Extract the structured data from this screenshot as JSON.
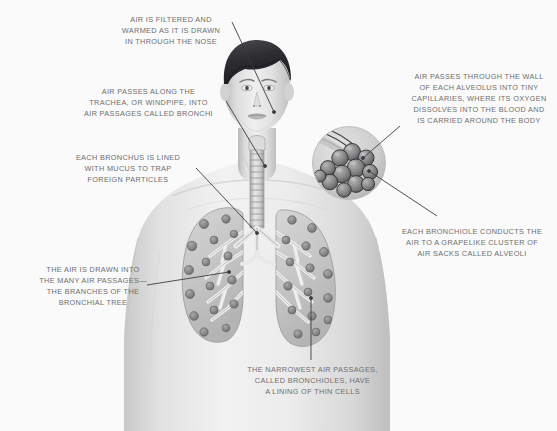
{
  "illustration": {
    "title": "Human Respiratory System",
    "subject": "respiratory-system-diagram",
    "background_color": "#fafafa",
    "text_color": "#6e6e6e",
    "leader_color": "#3c3c46",
    "figure_description": "Grayscale anatomical illustration of a person's head and upper torso shown front-facing, with the trachea, bronchi and both lungs rendered internally, plus a circular magnified inset of an alveolar cluster at the upper right"
  },
  "annotations": [
    {
      "id": "nose",
      "text": "AIR IS FILTERED AND\nWARMED AS IT IS DRAWN\nIN THROUGH THE NOSE",
      "align": "center",
      "x": 115,
      "y": 14,
      "width": 112,
      "leader": {
        "x1": 232,
        "y1": 22,
        "x2": 274,
        "y2": 112
      }
    },
    {
      "id": "trachea",
      "text": "AIR PASSES ALONG THE\nTRACHEA, OR WINDPIPE, INTO\nAIR PASSAGES CALLED BRONCHI",
      "align": "center",
      "x": 76,
      "y": 86,
      "width": 145,
      "leader": {
        "x1": 226,
        "y1": 101,
        "x2": 265,
        "y2": 166
      }
    },
    {
      "id": "bronchus",
      "text": "EACH BRONCHUS IS LINED\nWITH MUCUS TO TRAP\nFOREIGN PARTICLES",
      "align": "center",
      "x": 64,
      "y": 152,
      "width": 128,
      "leader": {
        "x1": 196,
        "y1": 168,
        "x2": 257,
        "y2": 233
      }
    },
    {
      "id": "bronchial-tree",
      "text": "THE AIR IS DRAWN INTO\nTHE MANY AIR PASSAGES—\nTHE BRANCHES OF THE\nBRONCHIAL TREE",
      "align": "center",
      "x": 28,
      "y": 264,
      "width": 130,
      "leader": {
        "x1": 147,
        "y1": 285,
        "x2": 229,
        "y2": 272
      }
    },
    {
      "id": "bronchioles",
      "text": "THE NARROWEST AIR PASSAGES,\nCALLED BRONCHIOLES, HAVE\nA LINING OF THIN CELLS",
      "align": "center",
      "x": 239,
      "y": 364,
      "width": 147,
      "leader": {
        "x1": 311,
        "y1": 360,
        "x2": 311,
        "y2": 298
      }
    },
    {
      "id": "alveolus-wall",
      "text": "AIR PASSES THROUGH THE WALL\nOF EACH ALVEOLUS INTO TINY\nCAPILLARIES, WHERE ITS OXYGEN\nDISSOLVES INTO THE BLOOD AND\nIS CARRIED AROUND THE BODY",
      "align": "center",
      "x": 404,
      "y": 71,
      "width": 150,
      "leader": {
        "x1": 400,
        "y1": 126,
        "x2": 363,
        "y2": 158
      }
    },
    {
      "id": "alveoli-cluster",
      "text": "EACH BRONCHIOLE CONDUCTS THE\nAIR TO A GRAPELIKE CLUSTER OF\nAIR SACKS CALLED ALVEOLI",
      "align": "center",
      "x": 396,
      "y": 226,
      "width": 152,
      "leader": {
        "x1": 437,
        "y1": 216,
        "x2": 369,
        "y2": 171
      }
    }
  ],
  "figure_parts": {
    "head": "head-and-face",
    "neck": "neck",
    "torso": "upper-torso-shoulders",
    "trachea": "trachea-windpipe",
    "left_lung": "left-lung",
    "right_lung": "right-lung",
    "bronchi": "bronchi-branches",
    "inset": "alveolar-cluster-inset"
  }
}
